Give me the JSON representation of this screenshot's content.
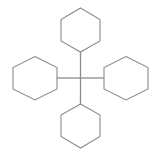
{
  "image": {
    "title": "Tetracyclohexylmethane skeletal structure",
    "background_color": "#ffffff",
    "line_color": "#8b8b8b",
    "width": 161,
    "height": 156
  },
  "structure": {
    "name": "tetracyclohexylmethane",
    "center_atom_label": "C",
    "center_atom": {
      "x": 80.5,
      "y": 78
    },
    "rings": [
      {
        "id": "ring-top",
        "label": "cyclohexyl-top",
        "orientation": "pointy-top",
        "attachment_vertex": {
          "x": 80.5,
          "y": 52
        },
        "points": "80.5,8 100,19.5 100,41 80.5,52 61,41 61,19.5"
      },
      {
        "id": "ring-left",
        "label": "cyclohexyl-left",
        "orientation": "pointy-top",
        "attachment_vertex": {
          "x": 57,
          "y": 78
        },
        "points": "35,56.5 57,67.5 57,89 35,100 13,89 13,67.5"
      },
      {
        "id": "ring-right",
        "label": "cyclohexyl-right",
        "orientation": "pointy-top",
        "attachment_vertex": {
          "x": 104,
          "y": 78
        },
        "points": "126,56.5 148,67.5 148,89 126,100 104,89 104,67.5"
      },
      {
        "id": "ring-bottom",
        "label": "cyclohexyl-bottom",
        "orientation": "pointy-top",
        "attachment_vertex": {
          "x": 80.5,
          "y": 104
        },
        "points": "80.5,104 100,115 100,136.5 80.5,148 61,136.5 61,115"
      }
    ],
    "bonds": [
      {
        "id": "bond-up",
        "label": "bond-center-to-top-ring",
        "x1": 80.5,
        "y1": 78,
        "x2": 80.5,
        "y2": 52
      },
      {
        "id": "bond-down",
        "label": "bond-center-to-bottom-ring",
        "x1": 80.5,
        "y1": 78,
        "x2": 80.5,
        "y2": 104
      },
      {
        "id": "bond-left",
        "label": "bond-center-to-left-ring",
        "x1": 80.5,
        "y1": 78,
        "x2": 57,
        "y2": 78
      },
      {
        "id": "bond-right",
        "label": "bond-center-to-right-ring",
        "x1": 80.5,
        "y1": 78,
        "x2": 104,
        "y2": 78
      }
    ]
  }
}
